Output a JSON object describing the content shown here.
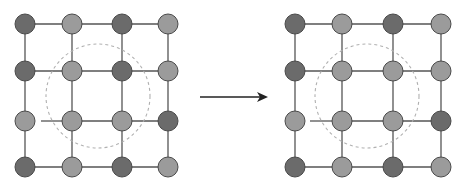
{
  "colors": {
    "dark": "#6b6b6b",
    "light": "#9b9b9b",
    "stroke": "#4a4a4a",
    "edge": "#555555",
    "dashed": "#b0b0b0",
    "arrow": "#222222"
  },
  "grids": [
    {
      "name": "before",
      "cols": [
        25,
        72,
        122,
        168
      ],
      "rows": [
        24,
        71,
        121,
        167
      ],
      "node_radius": 10,
      "nodes": [
        [
          "D",
          "L",
          "D",
          "L"
        ],
        [
          "D",
          "L",
          "D",
          "L"
        ],
        [
          "L",
          "L",
          "L",
          "D"
        ],
        [
          "D",
          "L",
          "D",
          "L"
        ]
      ],
      "missing_edge": {
        "row": 2,
        "from_col": 0,
        "to_col": 1,
        "gap_start_x": 41
      },
      "dashed_circle": {
        "cx": 98,
        "cy": 96,
        "r": 52
      }
    },
    {
      "name": "after",
      "cols": [
        295,
        342,
        393,
        441
      ],
      "rows": [
        24,
        71,
        121,
        167
      ],
      "node_radius": 10,
      "nodes": [
        [
          "D",
          "L",
          "D",
          "L"
        ],
        [
          "D",
          "L",
          "L",
          "L"
        ],
        [
          "L",
          "L",
          "L",
          "D"
        ],
        [
          "D",
          "L",
          "D",
          "L"
        ]
      ],
      "missing_edge": {
        "row": 2,
        "from_col": 0,
        "to_col": 1,
        "gap_start_x": 310
      },
      "dashed_circle": {
        "cx": 367,
        "cy": 96,
        "r": 52
      }
    }
  ],
  "arrow": {
    "x1": 200,
    "y1": 97,
    "x2": 268,
    "y2": 97
  }
}
